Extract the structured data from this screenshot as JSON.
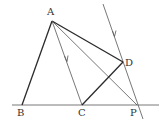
{
  "diagram": {
    "points": {
      "A": {
        "label": "A",
        "x": 52,
        "y": 21,
        "lx": 47,
        "ly": 15
      },
      "B": {
        "label": "B",
        "x": 22,
        "y": 105,
        "lx": 17,
        "ly": 116
      },
      "C": {
        "label": "C",
        "x": 82,
        "y": 105,
        "lx": 78,
        "ly": 116
      },
      "D": {
        "label": "D",
        "x": 123,
        "y": 62,
        "lx": 125,
        "ly": 66
      },
      "P": {
        "label": "P",
        "x": 137,
        "y": 105,
        "lx": 130,
        "ly": 116
      }
    },
    "segments": [
      {
        "name": "AB",
        "from": "A",
        "to": "B"
      },
      {
        "name": "AC",
        "from": "A",
        "to": "C",
        "arrow": true
      },
      {
        "name": "AD",
        "from": "A",
        "to": "D"
      },
      {
        "name": "AP",
        "from": "A",
        "to": "P"
      },
      {
        "name": "CD",
        "from": "C",
        "to": "D"
      }
    ],
    "baseline": {
      "x1": 12,
      "y1": 105,
      "x2": 159,
      "y2": 105
    },
    "parallel_line": {
      "x1": 103,
      "y1": 4,
      "x2": 143,
      "y2": 119,
      "arrow": true
    }
  }
}
